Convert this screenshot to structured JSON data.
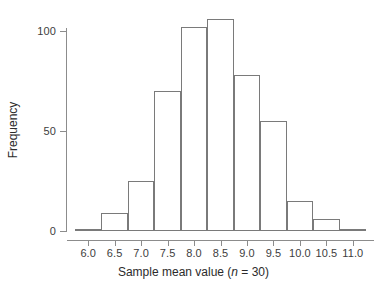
{
  "chart_data": {
    "type": "bar",
    "subtype": "histogram",
    "title": "",
    "subtitle": "",
    "xlabel": "Sample mean value (n = 30)",
    "xlabel_parts": {
      "before": "Sample mean value (",
      "italic": "n",
      "after": " = 30)"
    },
    "ylabel": "Frequency",
    "xlim": [
      5.6,
      11.4
    ],
    "ylim": [
      0,
      112
    ],
    "grid": false,
    "legend": null,
    "bin_width": 0.5,
    "bin_edges": [
      5.75,
      6.25,
      6.75,
      7.25,
      7.75,
      8.25,
      8.75,
      9.25,
      9.75,
      10.25,
      10.75,
      11.25
    ],
    "categories": [
      "5.75-6.25",
      "6.25-6.75",
      "6.75-7.25",
      "7.25-7.75",
      "7.75-8.25",
      "8.25-8.75",
      "8.75-9.25",
      "9.25-9.75",
      "9.75-10.25",
      "10.25-10.75",
      "10.75-11.25"
    ],
    "bin_centers": [
      6.0,
      6.5,
      7.0,
      7.5,
      8.0,
      8.5,
      9.0,
      9.5,
      10.0,
      10.5,
      11.0
    ],
    "values": [
      1,
      9,
      25,
      70,
      102,
      106,
      78,
      55,
      15,
      6,
      1
    ],
    "xticks": [
      "6.0",
      "6.5",
      "7.0",
      "7.5",
      "8.0",
      "8.5",
      "9.0",
      "9.5",
      "10.0",
      "10.5",
      "11.0"
    ],
    "xtick_values": [
      6.0,
      6.5,
      7.0,
      7.5,
      8.0,
      8.5,
      9.0,
      9.5,
      10.0,
      10.5,
      11.0
    ],
    "yticks": [
      "0",
      "50",
      "100"
    ],
    "ytick_values": [
      0,
      50,
      100
    ],
    "colors": {
      "bar_fill": "#ffffff",
      "bar_stroke": "#7a7a7a",
      "axis": "#8c8c8c",
      "tick_label": "#3d3d3d",
      "axis_title": "#2b2b2b",
      "background": "#ffffff"
    }
  }
}
